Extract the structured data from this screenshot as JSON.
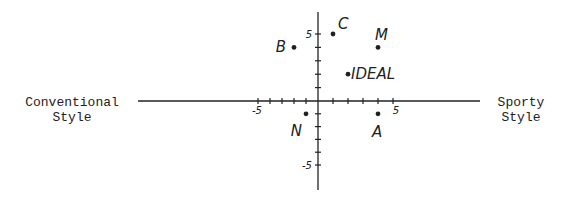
{
  "chart_data": {
    "type": "scatter",
    "title": "",
    "xlabel_left": "Conventional\nStyle",
    "xlabel_right": "Sporty\nStyle",
    "ylabel": "",
    "xlim": [
      -5,
      5
    ],
    "ylim": [
      -5,
      5
    ],
    "grid": false,
    "x_tick_labels": [
      {
        "value": -5,
        "label": "-5"
      },
      {
        "value": 5,
        "label": "5"
      }
    ],
    "y_tick_labels": [
      {
        "value": 5,
        "label": "5"
      },
      {
        "value": -5,
        "label": "-5"
      }
    ],
    "points": [
      {
        "label": "C",
        "x": 1,
        "y": 5
      },
      {
        "label": "M",
        "x": 4,
        "y": 4
      },
      {
        "label": "B",
        "x": -2,
        "y": 4
      },
      {
        "label": "IDEAL",
        "x": 2,
        "y": 2
      },
      {
        "label": "N",
        "x": -1,
        "y": -1
      },
      {
        "label": "A",
        "x": 4,
        "y": -1
      }
    ],
    "color": "#222222"
  }
}
